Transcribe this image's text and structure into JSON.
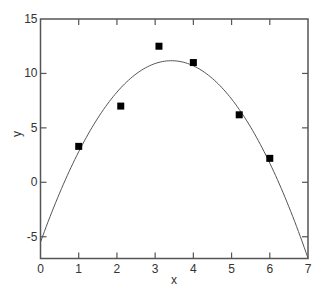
{
  "chart_data": {
    "type": "scatter",
    "title": "",
    "xlabel": "x",
    "ylabel": "y",
    "xlim": [
      0,
      7
    ],
    "ylim": [
      -7,
      15
    ],
    "xticks": [
      0,
      1,
      2,
      3,
      4,
      5,
      6,
      7
    ],
    "yticks": [
      -5,
      0,
      5,
      10,
      15
    ],
    "grid": false,
    "legend": null,
    "series": [
      {
        "name": "data",
        "type": "scatter",
        "marker": "square",
        "color": "#000000",
        "x": [
          1.0,
          2.1,
          3.1,
          4.0,
          5.2,
          6.0
        ],
        "y": [
          3.3,
          7.0,
          12.5,
          11.0,
          6.2,
          2.2
        ]
      },
      {
        "name": "quadratic fit",
        "type": "line",
        "color": "#555555",
        "equation": "y = -1.42x^2 + 9.73x - 5.5",
        "coefficients": {
          "a": -1.42,
          "b": 9.73,
          "c": -5.5
        },
        "x_range": [
          0,
          7
        ]
      }
    ]
  },
  "axes": {
    "x_label": "x",
    "y_label": "y"
  },
  "colors": {
    "frame": "#555555",
    "marker": "#000000",
    "curve": "#555555",
    "text": "#333333"
  }
}
